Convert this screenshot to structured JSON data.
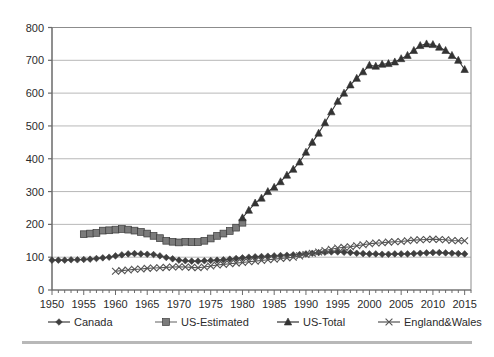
{
  "axes": {
    "y_ticks": [
      "0",
      "100",
      "200",
      "300",
      "400",
      "500",
      "600",
      "700",
      "800"
    ],
    "x_ticks": [
      "1950",
      "1955",
      "1960",
      "1965",
      "1970",
      "1975",
      "1980",
      "1985",
      "1990",
      "1995",
      "2000",
      "2005",
      "2010",
      "2015"
    ]
  },
  "legend": {
    "items": [
      {
        "label": "Canada",
        "marker": "diamond-marker",
        "color": "#3f3f3f"
      },
      {
        "label": "US-Estimated",
        "marker": "square-marker",
        "color": "#7b7b7b"
      },
      {
        "label": "US-Total",
        "marker": "triangle-marker",
        "color": "#333333"
      },
      {
        "label": "England&Wales",
        "marker": "x-marker",
        "color": "#545454"
      }
    ]
  },
  "chart_data": {
    "type": "line",
    "title": "",
    "xlabel": "",
    "ylabel": "",
    "xlim": [
      1950,
      2016
    ],
    "ylim": [
      0,
      800
    ],
    "grid": "horizontal",
    "legend_position": "bottom",
    "series": [
      {
        "name": "Canada",
        "marker": "diamond",
        "color": "#3f3f3f",
        "x": [
          1950,
          1951,
          1952,
          1953,
          1954,
          1955,
          1956,
          1957,
          1958,
          1959,
          1960,
          1961,
          1962,
          1963,
          1964,
          1965,
          1966,
          1967,
          1968,
          1969,
          1970,
          1971,
          1972,
          1973,
          1974,
          1975,
          1976,
          1977,
          1978,
          1979,
          1980,
          1981,
          1982,
          1983,
          1984,
          1985,
          1986,
          1987,
          1988,
          1989,
          1990,
          1991,
          1992,
          1993,
          1994,
          1995,
          1996,
          1997,
          1998,
          1999,
          2000,
          2001,
          2002,
          2003,
          2004,
          2005,
          2006,
          2007,
          2008,
          2009,
          2010,
          2011,
          2012,
          2013,
          2014,
          2015
        ],
        "values": [
          91,
          91,
          91,
          92,
          92,
          93,
          94,
          96,
          98,
          100,
          104,
          107,
          110,
          111,
          110,
          109,
          108,
          104,
          99,
          95,
          91,
          89,
          88,
          88,
          89,
          90,
          91,
          92,
          94,
          96,
          98,
          100,
          101,
          102,
          103,
          104,
          105,
          106,
          107,
          108,
          110,
          112,
          114,
          115,
          116,
          116,
          115,
          114,
          112,
          111,
          110,
          110,
          109,
          109,
          110,
          110,
          110,
          111,
          112,
          113,
          114,
          114,
          113,
          112,
          111,
          110
        ]
      },
      {
        "name": "US-Estimated",
        "marker": "square",
        "color": "#7b7b7b",
        "x": [
          1955,
          1956,
          1957,
          1958,
          1959,
          1960,
          1961,
          1962,
          1963,
          1964,
          1965,
          1966,
          1967,
          1968,
          1969,
          1970,
          1971,
          1972,
          1973,
          1974,
          1975,
          1976,
          1977,
          1978,
          1979,
          1980
        ],
        "values": [
          170,
          172,
          174,
          181,
          182,
          184,
          186,
          184,
          181,
          177,
          172,
          165,
          158,
          150,
          147,
          145,
          147,
          146,
          146,
          150,
          157,
          165,
          172,
          180,
          190,
          205
        ]
      },
      {
        "name": "US-Total",
        "marker": "triangle",
        "color": "#333333",
        "x": [
          1980,
          1981,
          1982,
          1983,
          1984,
          1985,
          1986,
          1987,
          1988,
          1989,
          1990,
          1991,
          1992,
          1993,
          1994,
          1995,
          1996,
          1997,
          1998,
          1999,
          2000,
          2001,
          2002,
          2003,
          2004,
          2005,
          2006,
          2007,
          2008,
          2009,
          2010,
          2011,
          2012,
          2013,
          2014,
          2015
        ],
        "values": [
          220,
          243,
          265,
          280,
          300,
          313,
          330,
          350,
          368,
          390,
          420,
          450,
          478,
          510,
          543,
          575,
          600,
          625,
          645,
          665,
          685,
          682,
          688,
          690,
          695,
          705,
          715,
          730,
          745,
          750,
          748,
          740,
          730,
          715,
          700,
          672
        ]
      },
      {
        "name": "England&Wales",
        "marker": "x",
        "color": "#545454",
        "x": [
          1960,
          1961,
          1962,
          1963,
          1964,
          1965,
          1966,
          1967,
          1968,
          1969,
          1970,
          1971,
          1972,
          1973,
          1974,
          1975,
          1976,
          1977,
          1978,
          1979,
          1980,
          1981,
          1982,
          1983,
          1984,
          1985,
          1986,
          1987,
          1988,
          1989,
          1990,
          1991,
          1992,
          1993,
          1994,
          1995,
          1996,
          1997,
          1998,
          1999,
          2000,
          2001,
          2002,
          2003,
          2004,
          2005,
          2006,
          2007,
          2008,
          2009,
          2010,
          2011,
          2012,
          2013,
          2014,
          2015
        ],
        "values": [
          57,
          59,
          61,
          63,
          64,
          66,
          67,
          68,
          69,
          70,
          71,
          70,
          69,
          68,
          70,
          73,
          76,
          78,
          80,
          82,
          84,
          86,
          88,
          90,
          92,
          94,
          96,
          98,
          100,
          104,
          108,
          112,
          116,
          120,
          124,
          128,
          130,
          132,
          135,
          138,
          141,
          143,
          144,
          146,
          147,
          148,
          150,
          152,
          153,
          154,
          155,
          154,
          153,
          151,
          150,
          150
        ]
      }
    ]
  }
}
